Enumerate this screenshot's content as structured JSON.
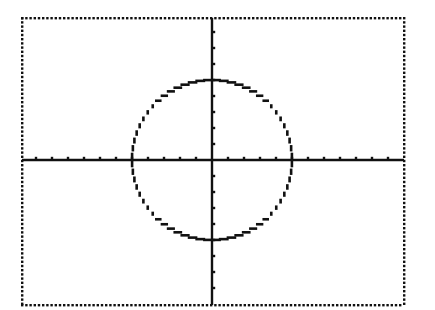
{
  "chart_data": {
    "type": "line",
    "title": "",
    "xlabel": "",
    "ylabel": "",
    "equation": "x^2 + y^2 = 25",
    "center": [
      0,
      0
    ],
    "radius": 5,
    "xlim": [
      -12,
      12
    ],
    "ylim": [
      -9,
      9
    ],
    "xtick_step": 1,
    "ytick_step": 1,
    "grid": false,
    "legend": null,
    "series": [
      {
        "name": "circle",
        "points": [
          [
            5,
            0
          ],
          [
            4,
            3
          ],
          [
            3,
            4
          ],
          [
            0,
            5
          ],
          [
            -3,
            4
          ],
          [
            -4,
            3
          ],
          [
            -5,
            0
          ],
          [
            -4,
            -3
          ],
          [
            -3,
            -4
          ],
          [
            0,
            -5
          ],
          [
            3,
            -4
          ],
          [
            4,
            -3
          ],
          [
            5,
            0
          ]
        ]
      }
    ],
    "frame_style": "dotted",
    "colors": {
      "ink": "#111111",
      "background": "#ffffff"
    }
  },
  "layout": {
    "frame": {
      "left": 22,
      "top": 18,
      "right": 404,
      "bottom": 305
    },
    "origin_px": [
      212,
      160
    ],
    "unit_px": 16
  }
}
